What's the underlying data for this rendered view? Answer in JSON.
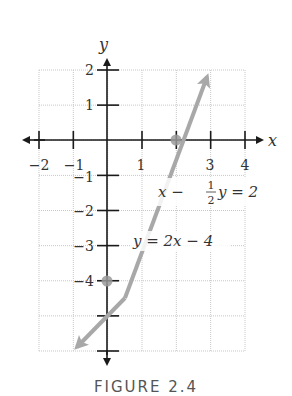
{
  "caption": "FIGURE 2.4",
  "axes": {
    "x_label": "x",
    "y_label": "y",
    "x_ticks": [
      "−2",
      "−1",
      "",
      "1",
      "",
      "3",
      "4"
    ],
    "y_ticks": [
      "2",
      "1",
      "",
      "−1",
      "−2",
      "−3",
      "−4",
      "",
      ""
    ]
  },
  "equations": {
    "eq1": {
      "left": "x − ",
      "num": "1",
      "den": "2",
      "right": "y = 2"
    },
    "eq2": "y = 2x − 4"
  },
  "colors": {
    "line": "#a8a8a8",
    "axis": "#1a1a1a",
    "grid": "#c8c8c8",
    "point": "#9a9a9a"
  },
  "chart_data": {
    "type": "line",
    "title": "",
    "xlabel": "x",
    "ylabel": "y",
    "xlim": [
      -2,
      4
    ],
    "ylim": [
      -6,
      2
    ],
    "grid": true,
    "x_tick_labels": [
      "-2",
      "-1",
      "1",
      "3",
      "4"
    ],
    "y_tick_labels": [
      "2",
      "1",
      "-1",
      "-2",
      "-3",
      "-4"
    ],
    "series": [
      {
        "name": "y = 2x - 4",
        "alt_form": "x - (1/2)y = 2",
        "x": [
          -1,
          0,
          2,
          3
        ],
        "y": [
          -6,
          -4,
          0,
          2
        ],
        "arrows_both_ends": true
      }
    ],
    "highlighted_points": [
      {
        "x": 2,
        "y": 0,
        "label": "x-intercept"
      },
      {
        "x": 0,
        "y": -4,
        "label": "y-intercept"
      }
    ],
    "annotations": [
      "x − ½y = 2",
      "y = 2x − 4"
    ]
  }
}
